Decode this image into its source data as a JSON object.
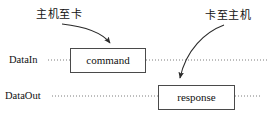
{
  "diagram": {
    "title_present": false,
    "background_color": "#ffffff",
    "line_color": "#4a4a4a",
    "text_color": "#111111",
    "annotations": [
      {
        "id": "host-to-card",
        "text": "主机至卡",
        "meaning": "Host to Card",
        "position": "top-left",
        "arrow_to": "command"
      },
      {
        "id": "card-to-host",
        "text": "卡至主机",
        "meaning": "Card to Host",
        "position": "top-right",
        "arrow_to": "response"
      }
    ],
    "lanes": [
      {
        "id": "datain",
        "label": "DataIn",
        "line_style": "dotted",
        "y": 60,
        "box_id": "command"
      },
      {
        "id": "dataout",
        "label": "DataOut",
        "line_style": "dotted",
        "y": 96,
        "box_id": "response"
      }
    ],
    "boxes": [
      {
        "id": "command",
        "label": "command",
        "lane": "datain",
        "x": 70,
        "y": 48,
        "width": 76,
        "height": 25
      },
      {
        "id": "response",
        "label": "response",
        "lane": "dataout",
        "x": 158,
        "y": 85,
        "width": 77,
        "height": 25
      }
    ],
    "arrows": [
      {
        "id": "arrow-host-to-card",
        "from_label": "主机至卡",
        "to_box": "command",
        "shape": "curve-down-right",
        "head": "filled-triangle"
      },
      {
        "id": "arrow-card-to-host",
        "from_label": "卡至主机",
        "to_box": "response",
        "shape": "curve-down-left",
        "head": "filled-triangle"
      }
    ]
  }
}
